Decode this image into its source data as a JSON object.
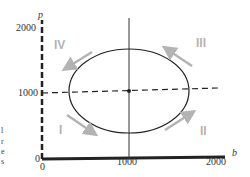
{
  "diagram": {
    "type": "phase-plane",
    "axes": {
      "x": {
        "label": "b",
        "ticks": [
          "0",
          "1000",
          "2000"
        ]
      },
      "y": {
        "label": "p",
        "ticks": [
          "0",
          "1000",
          "2000"
        ]
      }
    },
    "regions": [
      "I",
      "II",
      "III",
      "IV"
    ],
    "equilibrium": {
      "b": 1000,
      "p": 1000
    },
    "colors": {
      "curve": "#222222",
      "axes": "#222222",
      "arrows": "#b3b3b3",
      "region_labels": "#b3b3b3"
    },
    "edge_text": [
      "l",
      "r",
      "e",
      "s"
    ]
  }
}
